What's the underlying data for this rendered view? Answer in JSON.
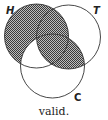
{
  "diagram": {
    "type": "venn",
    "circles": [
      {
        "id": "H",
        "label": "H",
        "cx": 36.5,
        "cy": 36,
        "r": 32
      },
      {
        "id": "T",
        "label": "T",
        "cx": 68.5,
        "cy": 37,
        "r": 32
      },
      {
        "id": "C",
        "label": "C",
        "cx": 52.5,
        "cy": 66,
        "r": 32
      }
    ],
    "shaded_regions": [
      "H only",
      "H∩T not C",
      "H∩T∩C",
      "T∩C not H"
    ],
    "unshaded_regions": [
      "T only",
      "C only",
      "H∩C not T"
    ],
    "shade_color": "#555555",
    "caption": "valid."
  }
}
